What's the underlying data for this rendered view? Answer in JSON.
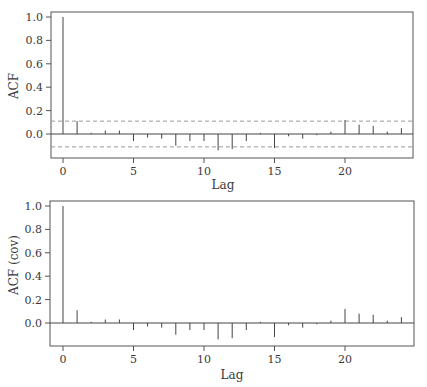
{
  "chart_data": [
    {
      "type": "bar",
      "subtype": "acf-stem",
      "title": "",
      "xlabel": "Lag",
      "ylabel": "ACF",
      "xlim": [
        -0.8,
        24.8
      ],
      "ylim": [
        -0.17,
        1.04
      ],
      "xticks": [
        0,
        5,
        10,
        15,
        20
      ],
      "yticks": [
        0.0,
        0.2,
        0.4,
        0.6,
        0.8,
        1.0
      ],
      "ytick_labels": [
        "0.0",
        "0.2",
        "0.4",
        "0.6",
        "0.8",
        "1.0"
      ],
      "grid": false,
      "legend": null,
      "confidence_bounds": [
        -0.11,
        0.11
      ],
      "confidence_style": "dashed",
      "lags": [
        0,
        1,
        2,
        3,
        4,
        5,
        6,
        7,
        8,
        9,
        10,
        11,
        12,
        13,
        14,
        15,
        16,
        17,
        18,
        19,
        20,
        21,
        22,
        23,
        24
      ],
      "values": [
        1.0,
        0.11,
        0.01,
        0.03,
        0.03,
        -0.06,
        -0.03,
        -0.04,
        -0.1,
        -0.06,
        -0.06,
        -0.14,
        -0.13,
        -0.06,
        0.01,
        -0.12,
        -0.02,
        -0.04,
        -0.01,
        0.02,
        0.12,
        0.08,
        0.07,
        0.02,
        0.05
      ]
    },
    {
      "type": "bar",
      "subtype": "acf-stem",
      "title": "",
      "xlabel": "Lag",
      "ylabel": "ACF (cov)",
      "xlim": [
        -0.8,
        24.8
      ],
      "ylim": [
        -0.2,
        1.04
      ],
      "xticks": [
        0,
        5,
        10,
        15,
        20
      ],
      "yticks": [
        0.0,
        0.2,
        0.4,
        0.6,
        0.8,
        1.0
      ],
      "ytick_labels": [
        "0.0",
        "0.2",
        "0.4",
        "0.6",
        "0.8",
        "1.0"
      ],
      "grid": false,
      "legend": null,
      "confidence_bounds": null,
      "lags": [
        0,
        1,
        2,
        3,
        4,
        5,
        6,
        7,
        8,
        9,
        10,
        11,
        12,
        13,
        14,
        15,
        16,
        17,
        18,
        19,
        20,
        21,
        22,
        23,
        24
      ],
      "values": [
        1.0,
        0.11,
        0.01,
        0.03,
        0.03,
        -0.06,
        -0.03,
        -0.04,
        -0.1,
        -0.06,
        -0.06,
        -0.14,
        -0.13,
        -0.06,
        0.01,
        -0.12,
        -0.02,
        -0.04,
        -0.01,
        0.02,
        0.12,
        0.08,
        0.07,
        0.02,
        0.05
      ]
    }
  ],
  "panels": [
    {
      "ylabel": "ACF",
      "xlabel": "Lag",
      "xtick_labels": [
        "0",
        "5",
        "10",
        "15",
        "20"
      ],
      "ytick_labels": [
        "0.0",
        "0.2",
        "0.4",
        "0.6",
        "0.8",
        "1.0"
      ]
    },
    {
      "ylabel": "ACF (cov)",
      "xlabel": "Lag",
      "xtick_labels": [
        "0",
        "5",
        "10",
        "15",
        "20"
      ],
      "ytick_labels": [
        "0.0",
        "0.2",
        "0.4",
        "0.6",
        "0.8",
        "1.0"
      ]
    }
  ],
  "colors": {
    "axis": "#555555",
    "stem": "#444444",
    "bound": "#999999",
    "text": "#3a3a3a"
  }
}
